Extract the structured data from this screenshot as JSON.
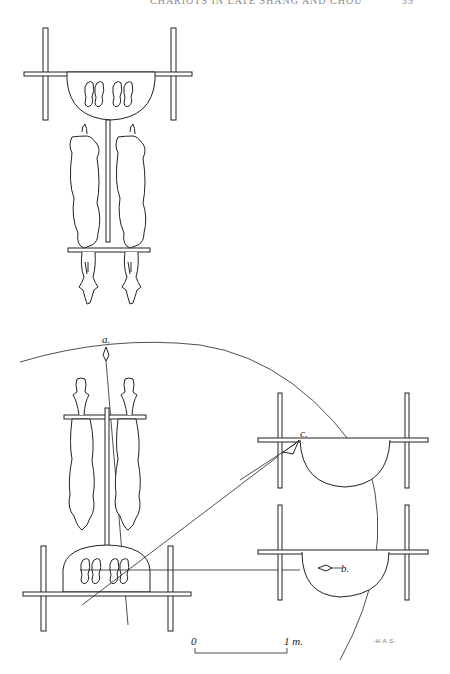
{
  "header": {
    "running_title": "CHARIOTS IN LATE SHANG AND CHOU",
    "page_number": "39"
  },
  "figure": {
    "labels": {
      "a": "a.",
      "b": "b.",
      "c": "c."
    },
    "scale_bar": {
      "start": "0",
      "end": "1 m."
    },
    "signature": "-H.A.S-"
  }
}
